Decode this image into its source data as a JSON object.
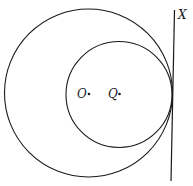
{
  "diagram": {
    "points": {
      "O": {
        "label": "O",
        "x": 89,
        "y": 94
      },
      "Q": {
        "label": "Q",
        "x": 119,
        "y": 94
      }
    },
    "line": {
      "label": "X"
    },
    "circles": [
      {
        "name": "large circle",
        "center": "O"
      },
      {
        "name": "small circle",
        "center": "Q"
      }
    ]
  }
}
